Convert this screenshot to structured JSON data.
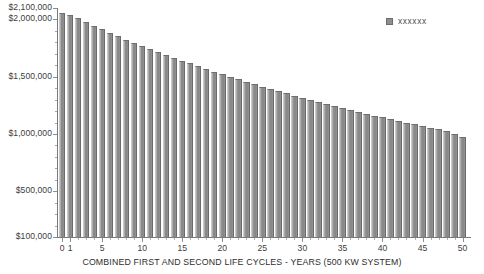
{
  "chart_data": {
    "type": "bar",
    "title": "",
    "xlabel": "COMBINED FIRST AND SECOND LIFE CYCLES - YEARS (500 KW SYSTEM)",
    "ylabel": "",
    "legend": [
      {
        "name": "xxxxxx",
        "color": "#8d8d8d"
      }
    ],
    "legend_position": "top-right",
    "grid": false,
    "ylim": [
      100000,
      2100000
    ],
    "ytick_labels": [
      "$2,100,000",
      "$2,000,000",
      "$1,500,000",
      "$1,000,000",
      "$500,000",
      "$100,000"
    ],
    "ytick_values": [
      2100000,
      2000000,
      1500000,
      1000000,
      500000,
      100000
    ],
    "xlim": [
      0,
      51
    ],
    "xtick_labels": [
      "0",
      "1",
      "5",
      "10",
      "15",
      "20",
      "25",
      "30",
      "35",
      "40",
      "45",
      "50"
    ],
    "xtick_values": [
      0,
      1,
      5,
      10,
      15,
      20,
      25,
      30,
      35,
      40,
      45,
      50
    ],
    "categories": [
      0,
      1,
      2,
      3,
      4,
      5,
      6,
      7,
      8,
      9,
      10,
      11,
      12,
      13,
      14,
      15,
      16,
      17,
      18,
      19,
      20,
      21,
      22,
      23,
      24,
      25,
      26,
      27,
      28,
      29,
      30,
      31,
      32,
      33,
      34,
      35,
      36,
      37,
      38,
      39,
      40,
      41,
      42,
      43,
      44,
      45,
      46,
      47,
      48,
      49,
      50
    ],
    "values": [
      2055000,
      2040000,
      2010000,
      1975000,
      1945000,
      1915000,
      1885000,
      1855000,
      1825000,
      1795000,
      1768000,
      1742000,
      1716000,
      1690000,
      1665000,
      1640000,
      1616000,
      1592000,
      1568000,
      1545000,
      1522000,
      1500000,
      1478000,
      1456000,
      1435000,
      1414000,
      1394000,
      1374000,
      1354000,
      1335000,
      1316000,
      1297000,
      1279000,
      1261000,
      1243000,
      1226000,
      1209000,
      1192000,
      1176000,
      1160000,
      1144000,
      1128000,
      1113000,
      1098000,
      1083000,
      1069000,
      1055000,
      1041000,
      1027000,
      1000000,
      975000
    ]
  },
  "axis": {
    "x_title": "COMBINED FIRST AND SECOND LIFE CYCLES - YEARS (500 KW SYSTEM)"
  },
  "legend": {
    "series_label": "xxxxxx"
  },
  "colors": {
    "bar_fill": "#8d8d8d",
    "bar_edge": "#6f6f6f",
    "axis": "#7a7a7a",
    "text": "#3c3c3c",
    "background": "#ffffff"
  }
}
